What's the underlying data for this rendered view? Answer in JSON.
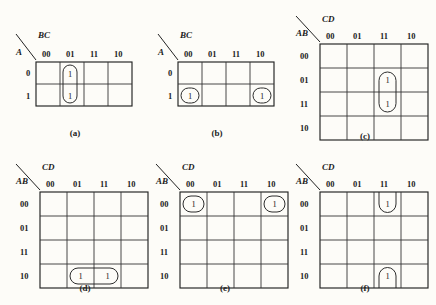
{
  "figure": {
    "type": "karnaugh-map-figure-grid",
    "background_color": "#fdfcf8",
    "ink_color": "#222222",
    "panel_count": 6
  },
  "maps": [
    {
      "id": "a",
      "caption": "(a)",
      "row_var": "A",
      "col_var": "BC",
      "col_labels": [
        "00",
        "01",
        "11",
        "10"
      ],
      "row_labels": [
        "0",
        "1"
      ],
      "cells": [
        {
          "row": "0",
          "col": "01",
          "value": "1"
        },
        {
          "row": "1",
          "col": "01",
          "value": "1"
        }
      ],
      "loops": [
        {
          "shape": "vertical-oval",
          "col": "01",
          "rows": [
            "0",
            "1"
          ],
          "wrap": false
        }
      ]
    },
    {
      "id": "b",
      "caption": "(b)",
      "row_var": "A",
      "col_var": "BC",
      "col_labels": [
        "00",
        "01",
        "11",
        "10"
      ],
      "row_labels": [
        "0",
        "1"
      ],
      "cells": [
        {
          "row": "1",
          "col": "00",
          "value": "1"
        },
        {
          "row": "1",
          "col": "10",
          "value": "1"
        }
      ],
      "loops": [
        {
          "shape": "single-cell-oval",
          "col": "00",
          "rows": [
            "1"
          ],
          "wrap": false
        },
        {
          "shape": "single-cell-oval",
          "col": "10",
          "rows": [
            "1"
          ],
          "wrap": false
        }
      ]
    },
    {
      "id": "c",
      "caption": "(c)",
      "row_var": "AB",
      "col_var": "CD",
      "col_labels": [
        "00",
        "01",
        "11",
        "10"
      ],
      "row_labels": [
        "00",
        "01",
        "11",
        "10"
      ],
      "cells": [
        {
          "row": "01",
          "col": "11",
          "value": "1"
        },
        {
          "row": "11",
          "col": "11",
          "value": "1"
        }
      ],
      "loops": [
        {
          "shape": "vertical-oval",
          "col": "11",
          "rows": [
            "01",
            "11"
          ],
          "wrap": false
        }
      ]
    },
    {
      "id": "d",
      "caption": "(d)",
      "row_var": "AB",
      "col_var": "CD",
      "col_labels": [
        "00",
        "01",
        "11",
        "10"
      ],
      "row_labels": [
        "00",
        "01",
        "11",
        "10"
      ],
      "cells": [
        {
          "row": "10",
          "col": "01",
          "value": "1"
        },
        {
          "row": "10",
          "col": "11",
          "value": "1"
        }
      ],
      "loops": [
        {
          "shape": "horizontal-oval",
          "row": "10",
          "cols": [
            "01",
            "11"
          ],
          "wrap": false
        }
      ]
    },
    {
      "id": "e",
      "caption": "(e)",
      "row_var": "AB",
      "col_var": "CD",
      "col_labels": [
        "00",
        "01",
        "11",
        "10"
      ],
      "row_labels": [
        "00",
        "01",
        "11",
        "10"
      ],
      "cells": [
        {
          "row": "00",
          "col": "00",
          "value": "1"
        },
        {
          "row": "00",
          "col": "10",
          "value": "1"
        }
      ],
      "loops": [
        {
          "shape": "single-cell-oval",
          "row": "00",
          "cols": [
            "00"
          ],
          "wrap": false
        },
        {
          "shape": "single-cell-oval",
          "row": "00",
          "cols": [
            "10"
          ],
          "wrap": false
        }
      ]
    },
    {
      "id": "f",
      "caption": "(f)",
      "row_var": "AB",
      "col_var": "CD",
      "col_labels": [
        "00",
        "01",
        "11",
        "10"
      ],
      "row_labels": [
        "00",
        "01",
        "11",
        "10"
      ],
      "cells": [
        {
          "row": "00",
          "col": "11",
          "value": "1"
        },
        {
          "row": "10",
          "col": "11",
          "value": "1"
        }
      ],
      "loops": [
        {
          "shape": "half-oval-open-top",
          "row": "00",
          "col": "11",
          "wrap": true
        },
        {
          "shape": "half-oval-open-bottom",
          "row": "10",
          "col": "11",
          "wrap": true
        }
      ]
    }
  ]
}
